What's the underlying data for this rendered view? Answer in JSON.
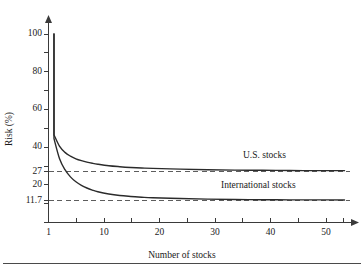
{
  "chart_data": {
    "type": "line",
    "title": "",
    "xlabel": "Number of stocks",
    "ylabel": "Risk (%)",
    "xlim": [
      1,
      56
    ],
    "ylim": [
      0,
      100
    ],
    "grid": false,
    "legend_position": "inline-right",
    "x_ticks": [
      1,
      5,
      10,
      15,
      20,
      25,
      30,
      35,
      40,
      45,
      50,
      55
    ],
    "x_tick_labels": [
      "1",
      "",
      "10",
      "",
      "20",
      "",
      "30",
      "",
      "40",
      "",
      "50",
      ""
    ],
    "y_ticks": [
      0,
      10,
      20,
      30,
      40,
      50,
      60,
      70,
      80,
      90,
      100
    ],
    "y_tick_labels": [
      "100",
      "80",
      "60",
      "40",
      "27",
      "20",
      "11.7"
    ],
    "y_labeled_values": [
      100,
      80,
      60,
      40,
      27,
      20,
      11.7
    ],
    "annotations": [
      {
        "name": "us-asymptote",
        "value": 27,
        "style": "dashed"
      },
      {
        "name": "international-asymptote",
        "value": 11.7,
        "style": "dashed"
      }
    ],
    "series": [
      {
        "name": "U.S. stocks",
        "asymptote": 27,
        "x": [
          2,
          2,
          3,
          4,
          5,
          6,
          7,
          8,
          9,
          10,
          12,
          14,
          16,
          18,
          20,
          25,
          30,
          35,
          40,
          45,
          50,
          55
        ],
        "values": [
          100,
          46.5,
          40.5,
          37.2,
          35.2,
          33.8,
          32.8,
          32.0,
          31.4,
          30.9,
          30.1,
          29.6,
          29.2,
          28.9,
          28.7,
          28.3,
          28.0,
          27.8,
          27.7,
          27.6,
          27.5,
          27.5
        ]
      },
      {
        "name": "International stocks",
        "asymptote": 11.7,
        "x": [
          2,
          2,
          3,
          4,
          5,
          6,
          7,
          8,
          9,
          10,
          12,
          14,
          16,
          18,
          20,
          25,
          30,
          35,
          40,
          45,
          50,
          55
        ],
        "values": [
          100,
          44.5,
          34.0,
          28.0,
          24.2,
          21.6,
          19.7,
          18.3,
          17.2,
          16.3,
          15.1,
          14.3,
          13.8,
          13.4,
          13.1,
          12.7,
          12.4,
          12.2,
          12.1,
          12.0,
          12.0,
          11.95
        ]
      }
    ]
  },
  "axes": {
    "y_title": "Risk (%)",
    "x_title": "Number of stocks",
    "y_labels": {
      "t100": "100",
      "t80": "80",
      "t60": "60",
      "t40": "40",
      "t27": "27",
      "t20": "20",
      "t117": "11.7"
    },
    "x_labels": {
      "t1": "1",
      "t10": "10",
      "t20": "20",
      "t30": "30",
      "t40": "40",
      "t50": "50"
    }
  },
  "series_labels": {
    "us": "U.S. stocks",
    "international": "International stocks"
  },
  "colors": {
    "curve": "#2b2b2b",
    "axis": "#3a3a3a",
    "dashed": "#5d5d5d",
    "text": "#1a1a1a",
    "background": "#ffffff",
    "rule": "#4a4a4a"
  }
}
